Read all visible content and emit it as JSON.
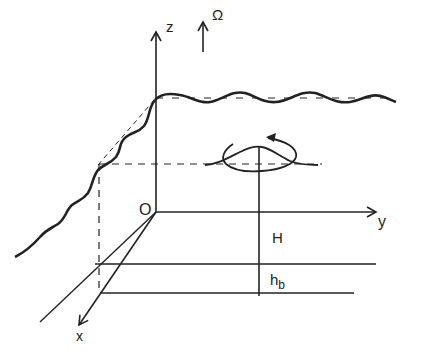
{
  "diagram": {
    "labels": {
      "z_axis": "z",
      "y_axis": "y",
      "x_axis": "x",
      "origin": "O",
      "rotation": "Ω",
      "depth": "H",
      "bottom_layer_main": "h",
      "bottom_layer_sub": "b"
    },
    "colors": {
      "ink": "#222222",
      "background": "#ffffff"
    }
  }
}
